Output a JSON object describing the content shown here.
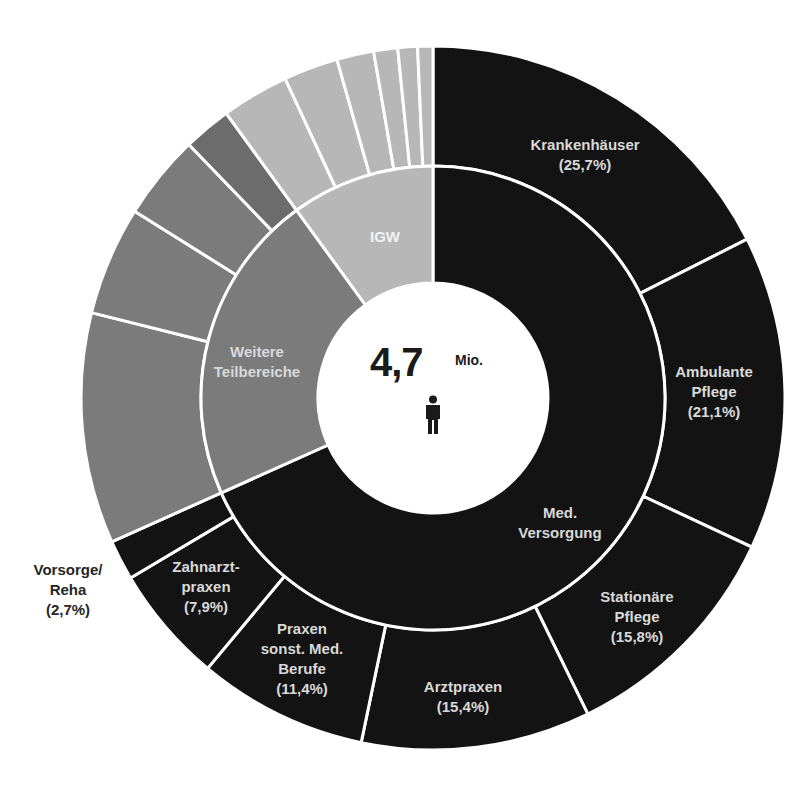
{
  "chart_data": {
    "type": "sunburst",
    "title": "",
    "center": {
      "value": "4,7",
      "unit": "Mio.",
      "icon": "person-icon"
    },
    "geometry": {
      "cx": 433,
      "cy": 398,
      "r_hole": 115,
      "r_mid": 232,
      "r_outer": 352,
      "start_angle_deg": 0,
      "direction": "clockwise"
    },
    "colors": {
      "dark": "#131313",
      "weitere": "#7b7b7b",
      "weitere_alt": "#6c6c6c",
      "igw": "#b7b7b7",
      "separator": "#ffffff"
    },
    "inner_ring": [
      {
        "name": "Med. Versorgung",
        "value": 68.3,
        "color": "#131313"
      },
      {
        "name": "Weitere Teilbereiche",
        "value": 21.7,
        "color": "#7b7b7b"
      },
      {
        "name": "IGW",
        "value": 10.0,
        "color": "#b7b7b7"
      }
    ],
    "outer_ring": [
      {
        "parent": "Med. Versorgung",
        "name": "Krankenhäuser",
        "share_of_parent_pct": 25.7,
        "value": 17.55,
        "color": "#131313"
      },
      {
        "parent": "Med. Versorgung",
        "name": "Ambulante Pflege",
        "share_of_parent_pct": 21.1,
        "value": 14.41,
        "color": "#131313"
      },
      {
        "parent": "Med. Versorgung",
        "name": "Stationäre Pflege",
        "share_of_parent_pct": 15.8,
        "value": 10.79,
        "color": "#131313"
      },
      {
        "parent": "Med. Versorgung",
        "name": "Arztpraxen",
        "share_of_parent_pct": 15.4,
        "value": 10.52,
        "color": "#131313"
      },
      {
        "parent": "Med. Versorgung",
        "name": "Praxen sonst. Med. Berufe",
        "share_of_parent_pct": 11.4,
        "value": 7.79,
        "color": "#131313"
      },
      {
        "parent": "Med. Versorgung",
        "name": "Zahnarztpraxen",
        "share_of_parent_pct": 7.9,
        "value": 5.4,
        "color": "#131313"
      },
      {
        "parent": "Med. Versorgung",
        "name": "Vorsorge/Reha",
        "share_of_parent_pct": 2.7,
        "value": 1.84,
        "color": "#131313"
      },
      {
        "parent": "Weitere Teilbereiche",
        "name": "",
        "value": 10.6,
        "color": "#7b7b7b"
      },
      {
        "parent": "Weitere Teilbereiche",
        "name": "",
        "value": 5.0,
        "color": "#7b7b7b"
      },
      {
        "parent": "Weitere Teilbereiche",
        "name": "",
        "value": 3.9,
        "color": "#7b7b7b"
      },
      {
        "parent": "Weitere Teilbereiche",
        "name": "",
        "value": 2.2,
        "color": "#6c6c6c"
      },
      {
        "parent": "IGW",
        "name": "",
        "value": 3.1,
        "color": "#b7b7b7"
      },
      {
        "parent": "IGW",
        "name": "",
        "value": 2.5,
        "color": "#b7b7b7"
      },
      {
        "parent": "IGW",
        "name": "",
        "value": 1.7,
        "color": "#b7b7b7"
      },
      {
        "parent": "IGW",
        "name": "",
        "value": 1.1,
        "color": "#b7b7b7"
      },
      {
        "parent": "IGW",
        "name": "",
        "value": 0.9,
        "color": "#b7b7b7"
      },
      {
        "parent": "IGW",
        "name": "",
        "value": 0.7,
        "color": "#b7b7b7"
      }
    ]
  },
  "center": {
    "value": "4,7",
    "unit": "Mio."
  },
  "labels": {
    "inner": {
      "med": [
        "Med.",
        "Versorgung"
      ],
      "weitere": [
        "Weitere",
        "Teilbereiche"
      ],
      "igw": [
        "IGW"
      ]
    },
    "outer": {
      "krankenhaeuser": [
        "Krankenhäuser",
        "(25,7%)"
      ],
      "ambulante": [
        "Ambulante",
        "Pflege",
        "(21,1%)"
      ],
      "stationaere": [
        "Stationäre",
        "Pflege",
        "(15,8%)"
      ],
      "arztpraxen": [
        "Arztpraxen",
        "(15,4%)"
      ],
      "praxen_sonst": [
        "Praxen",
        "sonst. Med.",
        "Berufe",
        "(11,4%)"
      ],
      "zahnarzt": [
        "Zahnarzt-",
        "praxen",
        "(7,9%)"
      ],
      "vorsorge": [
        "Vorsorge/",
        "Reha",
        "(2,7%)"
      ]
    }
  }
}
